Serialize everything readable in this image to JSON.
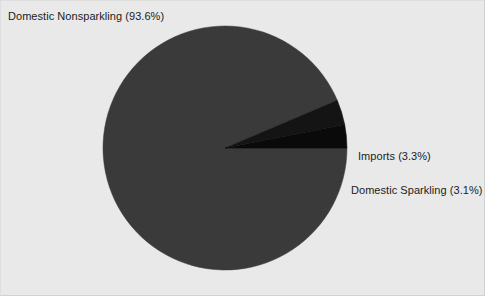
{
  "chart_data": {
    "type": "pie",
    "title": "",
    "subtitle": "",
    "xlabel": "",
    "ylabel": "",
    "grid": false,
    "legend_position": "none",
    "labels_outside": true,
    "start_angle_deg": 0,
    "direction": "clockwise",
    "categories": [
      "Domestic Nonsparkling",
      "Imports",
      "Domestic Sparkling"
    ],
    "values": [
      93.6,
      3.3,
      3.1
    ],
    "units": "percent",
    "colors": [
      "#3a3a3a",
      "#141414",
      "#0a0a0a"
    ],
    "slices": [
      {
        "name": "Domestic Nonsparkling",
        "value": 93.6,
        "label": "Domestic Nonsparkling (93.6%)",
        "color": "#3a3a3a"
      },
      {
        "name": "Imports",
        "value": 3.3,
        "label": "Imports (3.3%)",
        "color": "#141414"
      },
      {
        "name": "Domestic Sparkling",
        "value": 3.1,
        "label": "Domestic Sparkling (3.1%)",
        "color": "#0a0a0a"
      }
    ]
  },
  "figure": {
    "background_color": "#e9e9e9",
    "border_color": "#d8d8d8",
    "width": 485,
    "height": 296,
    "center_x": 225,
    "center_y": 148,
    "radius": 122
  }
}
